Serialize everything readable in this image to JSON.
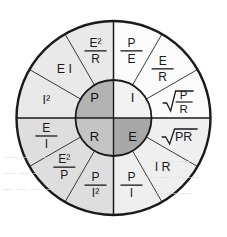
{
  "diagram": {
    "center": {
      "cx": 113.5,
      "cy": 118,
      "outer_r": 97,
      "hub_r": 38
    },
    "stroke_color": "#1a1a1a",
    "hub": {
      "quadrants": [
        {
          "id": "power",
          "label": "P",
          "position": "top-left",
          "fill": "#b3b3b3"
        },
        {
          "id": "current",
          "label": "I",
          "position": "top-right",
          "fill": "#f2f2f2"
        },
        {
          "id": "resistance",
          "label": "R",
          "position": "bottom-left",
          "fill": "#c4c4c4"
        },
        {
          "id": "voltage",
          "label": "E",
          "position": "bottom-right",
          "fill": "#a8a8a8"
        }
      ]
    },
    "ring": {
      "quadrant_fills": {
        "top-left": "#e9e9e9",
        "top-right": "#fbfbfb",
        "bottom-left": "#dedede",
        "bottom-right": "#efefef"
      },
      "segments": [
        {
          "quadrant": "power",
          "index": 0,
          "text": "I²R",
          "type": "plain",
          "num": "I²",
          "den": "",
          "sup": "2"
        },
        {
          "quadrant": "power",
          "index": 1,
          "text": "E I",
          "type": "plain",
          "num": "E I",
          "den": "",
          "sup": ""
        },
        {
          "quadrant": "power",
          "index": 2,
          "text": "E²/R",
          "type": "fraction",
          "num": "E²",
          "den": "R",
          "sup": ""
        },
        {
          "quadrant": "current",
          "index": 0,
          "text": "P/E",
          "type": "fraction",
          "num": "P",
          "den": "E",
          "sup": ""
        },
        {
          "quadrant": "current",
          "index": 1,
          "text": "E/R",
          "type": "fraction",
          "num": "E",
          "den": "R",
          "sup": ""
        },
        {
          "quadrant": "current",
          "index": 2,
          "text": "√(P/R)",
          "type": "radical-fraction",
          "num": "P",
          "den": "R",
          "sup": ""
        },
        {
          "quadrant": "voltage",
          "index": 0,
          "text": "√PR",
          "type": "radical",
          "num": "PR",
          "den": "",
          "sup": ""
        },
        {
          "quadrant": "voltage",
          "index": 1,
          "text": "I R",
          "type": "plain",
          "num": "I R",
          "den": "",
          "sup": ""
        },
        {
          "quadrant": "voltage",
          "index": 2,
          "text": "P/I",
          "type": "fraction",
          "num": "P",
          "den": "I",
          "sup": ""
        },
        {
          "quadrant": "resistance",
          "index": 0,
          "text": "P/I²",
          "type": "fraction",
          "num": "P",
          "den": "I²",
          "sup": ""
        },
        {
          "quadrant": "resistance",
          "index": 1,
          "text": "E²/P",
          "type": "fraction",
          "num": "E²",
          "den": "P",
          "sup": ""
        },
        {
          "quadrant": "resistance",
          "index": 2,
          "text": "E/I",
          "type": "fraction",
          "num": "E",
          "den": "I",
          "sup": ""
        }
      ]
    }
  },
  "background_bleed": {
    "lines": [
      {
        "text": "— — — — —",
        "x": 6,
        "y": 150
      },
      {
        "text": "— — — —",
        "x": 4,
        "y": 166
      },
      {
        "text": "— — — — —",
        "x": 2,
        "y": 182
      },
      {
        "text": "— — —",
        "x": 150,
        "y": 154
      },
      {
        "text": "— — — —",
        "x": 145,
        "y": 170
      },
      {
        "text": "— — —",
        "x": 152,
        "y": 186
      }
    ]
  }
}
